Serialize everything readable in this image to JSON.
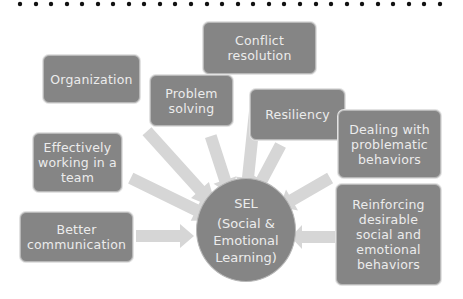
{
  "diagram": {
    "type": "hub-and-spoke",
    "border_style": "dotted-top",
    "colors": {
      "node_fill": "#858585",
      "node_text": "#ececec",
      "arrow_fill": "#d6d6d6",
      "background": "#ffffff"
    },
    "center": {
      "title": "SEL",
      "line1": "(Social &",
      "line2": "Emotional",
      "line3": "Learning)"
    },
    "nodes": [
      {
        "id": "conflict-resolution",
        "label": "Conflict resolution"
      },
      {
        "id": "organization",
        "label": "Organization"
      },
      {
        "id": "problem-solving",
        "label": "Problem solving"
      },
      {
        "id": "resiliency",
        "label": "Resiliency"
      },
      {
        "id": "dealing-with-problematic-behaviors",
        "label": "Dealing with problematic behaviors"
      },
      {
        "id": "effectively-working-in-a-team",
        "label": "Effectively working in a team"
      },
      {
        "id": "better-communication",
        "label": "Better communication"
      },
      {
        "id": "reinforcing-desirable-behaviors",
        "label": "Reinforcing desirable social and emotional behaviors"
      }
    ]
  }
}
